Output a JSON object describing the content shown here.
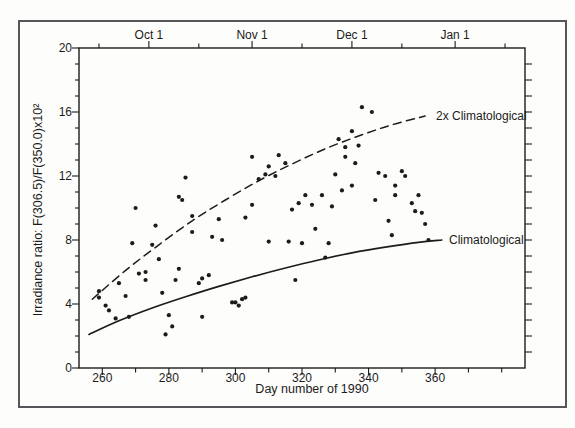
{
  "figure": {
    "background": "#fdfdfb",
    "border_color": "#55565a",
    "ink_color": "#1c1c1c"
  },
  "chart_data": {
    "type": "scatter",
    "title": "",
    "xlabel": "Day number of 1990",
    "ylabel": "Irradiance ratio: F(306.5)/F(350.0)x10²",
    "xlim": [
      253,
      387
    ],
    "ylim": [
      0,
      20
    ],
    "grid": "off",
    "x_ticks_major": [
      260,
      280,
      300,
      320,
      340,
      360
    ],
    "x_tick_labels": [
      "260",
      "280",
      "300",
      "320",
      "340",
      "360"
    ],
    "x_ticks_minor": [
      270,
      290,
      310,
      330,
      350,
      370,
      380
    ],
    "y_ticks_major": [
      0,
      4,
      8,
      12,
      16,
      20
    ],
    "y_tick_labels": [
      "0",
      "4",
      "8",
      "12",
      "16",
      "20"
    ],
    "y_minor_step": 1,
    "top_axis": {
      "tick_labels": [
        {
          "label": "Oct 1",
          "day": 274
        },
        {
          "label": "Nov 1",
          "day": 305
        },
        {
          "label": "Dec 1",
          "day": 335
        },
        {
          "label": "Jan 1",
          "day": 366
        }
      ],
      "minor_tick_days": [
        259,
        289,
        320,
        350,
        381
      ]
    },
    "right_axis": {
      "tick_step": 1,
      "tick_min": 1,
      "tick_max": 19
    },
    "points": [
      [
        259,
        4.8
      ],
      [
        259,
        4.4
      ],
      [
        261,
        3.9
      ],
      [
        262,
        3.6
      ],
      [
        264,
        3.1
      ],
      [
        265,
        5.3
      ],
      [
        267,
        4.5
      ],
      [
        268,
        3.2
      ],
      [
        269,
        7.8
      ],
      [
        270,
        10.0
      ],
      [
        271,
        5.9
      ],
      [
        273,
        6.0
      ],
      [
        273,
        5.5
      ],
      [
        275,
        7.7
      ],
      [
        276,
        8.9
      ],
      [
        277,
        6.8
      ],
      [
        278,
        4.7
      ],
      [
        279,
        2.1
      ],
      [
        280,
        3.3
      ],
      [
        281,
        2.6
      ],
      [
        282,
        5.5
      ],
      [
        283,
        6.2
      ],
      [
        283,
        10.7
      ],
      [
        284,
        10.5
      ],
      [
        285,
        11.9
      ],
      [
        287,
        9.5
      ],
      [
        287,
        8.5
      ],
      [
        289,
        5.3
      ],
      [
        290,
        5.6
      ],
      [
        290,
        3.2
      ],
      [
        292,
        5.8
      ],
      [
        293,
        8.2
      ],
      [
        295,
        9.3
      ],
      [
        296,
        8.0
      ],
      [
        299,
        4.1
      ],
      [
        300,
        4.1
      ],
      [
        301,
        3.9
      ],
      [
        302,
        4.3
      ],
      [
        303,
        4.4
      ],
      [
        303,
        9.4
      ],
      [
        305,
        10.2
      ],
      [
        305,
        13.2
      ],
      [
        307,
        11.8
      ],
      [
        309,
        12.1
      ],
      [
        310,
        12.6
      ],
      [
        310,
        7.9
      ],
      [
        312,
        12.0
      ],
      [
        313,
        13.3
      ],
      [
        315,
        12.8
      ],
      [
        316,
        7.9
      ],
      [
        317,
        9.9
      ],
      [
        318,
        5.5
      ],
      [
        319,
        10.3
      ],
      [
        320,
        7.8
      ],
      [
        321,
        10.8
      ],
      [
        323,
        10.2
      ],
      [
        324,
        8.7
      ],
      [
        326,
        10.8
      ],
      [
        327,
        6.9
      ],
      [
        328,
        7.8
      ],
      [
        329,
        10.1
      ],
      [
        330,
        12.1
      ],
      [
        331,
        14.3
      ],
      [
        332,
        11.1
      ],
      [
        333,
        13.8
      ],
      [
        333,
        13.2
      ],
      [
        335,
        14.8
      ],
      [
        335,
        11.4
      ],
      [
        336,
        12.8
      ],
      [
        337,
        13.9
      ],
      [
        338,
        16.3
      ],
      [
        341,
        16.0
      ],
      [
        342,
        10.5
      ],
      [
        343,
        12.2
      ],
      [
        345,
        12.0
      ],
      [
        346,
        9.2
      ],
      [
        347,
        8.3
      ],
      [
        348,
        11.4
      ],
      [
        348,
        10.8
      ],
      [
        350,
        12.3
      ],
      [
        351,
        12.0
      ],
      [
        353,
        10.3
      ],
      [
        354,
        9.8
      ],
      [
        355,
        10.8
      ],
      [
        356,
        9.7
      ],
      [
        357,
        9.0
      ],
      [
        358,
        8.0
      ]
    ],
    "curves": [
      {
        "name": "climatological",
        "label": "Climatological",
        "style": "solid",
        "points": [
          [
            256,
            2.1
          ],
          [
            265,
            2.95
          ],
          [
            275,
            3.75
          ],
          [
            285,
            4.45
          ],
          [
            295,
            5.1
          ],
          [
            305,
            5.7
          ],
          [
            315,
            6.25
          ],
          [
            325,
            6.75
          ],
          [
            335,
            7.2
          ],
          [
            345,
            7.55
          ],
          [
            355,
            7.85
          ],
          [
            362,
            8.0
          ]
        ]
      },
      {
        "name": "2x-climatological",
        "label": "2x Climatological",
        "style": "dashed",
        "points": [
          [
            257,
            4.3
          ],
          [
            267,
            6.1
          ],
          [
            277,
            7.7
          ],
          [
            287,
            9.2
          ],
          [
            297,
            10.5
          ],
          [
            307,
            11.7
          ],
          [
            317,
            12.75
          ],
          [
            327,
            13.7
          ],
          [
            337,
            14.5
          ],
          [
            347,
            15.2
          ],
          [
            357,
            15.75
          ]
        ]
      }
    ]
  }
}
